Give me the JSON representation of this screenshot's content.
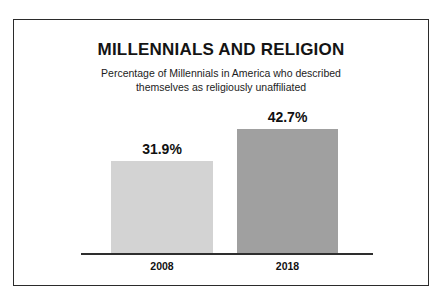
{
  "chart_data": {
    "type": "bar",
    "title": "MILLENNIALS AND RELIGION",
    "subtitle_line1": "Percentage of Millennials in America who described",
    "subtitle_line2": "themselves as religiously unaffiliated",
    "categories": [
      "2008",
      "2018"
    ],
    "values": [
      31.9,
      42.7
    ],
    "value_labels": [
      "31.9%",
      "42.7%"
    ],
    "xlabel": "",
    "ylabel": "",
    "ylim": [
      0,
      42.7
    ],
    "grid": false,
    "legend": false,
    "axis_visible": {
      "x_baseline": true,
      "y_axis": false
    },
    "bar_colors": [
      "#d3d3d3",
      "#a0a0a0"
    ],
    "series": [
      {
        "name": "Percentage religiously unaffiliated",
        "points": [
          {
            "category": "2008",
            "value": 31.9,
            "label": "31.9%",
            "color": "#d3d3d3"
          },
          {
            "category": "2018",
            "value": 42.7,
            "label": "42.7%",
            "color": "#a0a0a0"
          }
        ]
      }
    ]
  },
  "colors": {
    "background": "#ffffff",
    "border": "#2b2b2b",
    "baseline": "#2e2e2e",
    "text": "#111111",
    "bar_light": "#d3d3d3",
    "bar_dark": "#a0a0a0"
  }
}
